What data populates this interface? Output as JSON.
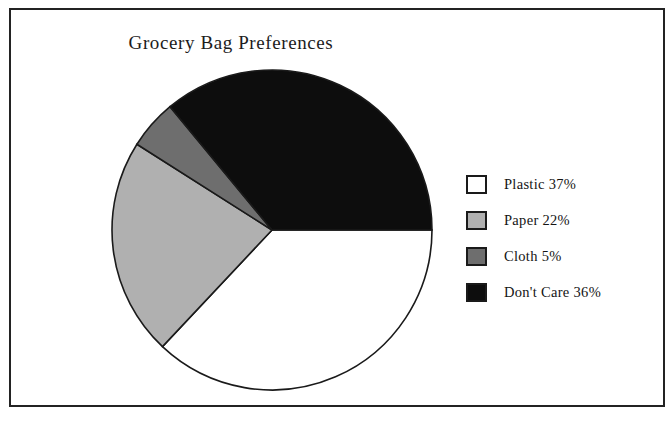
{
  "chart_data": {
    "type": "pie",
    "title": "Grocery Bag Preferences",
    "categories": [
      "Plastic",
      "Paper",
      "Cloth",
      "Don't Care"
    ],
    "values": [
      37,
      22,
      5,
      36
    ],
    "value_unit": "%",
    "labels": [
      "Plastic 37%",
      "Paper 22%",
      "Cloth 5%",
      "Don't Care 36%"
    ],
    "colors": [
      "#ffffff",
      "#b0b0b0",
      "#6e6e6e",
      "#0d0d0d"
    ],
    "slice_border_color": "#1a1a1a",
    "start_angle_deg": 0,
    "direction": "clockwise",
    "legend_position": "right",
    "grid": false,
    "xlabel": "",
    "ylabel": ""
  },
  "legend": {
    "items": [
      {
        "label": "Plastic 37%",
        "color": "#ffffff",
        "name": "plastic"
      },
      {
        "label": "Paper 22%",
        "color": "#b0b0b0",
        "name": "paper"
      },
      {
        "label": "Cloth 5%",
        "color": "#6e6e6e",
        "name": "cloth"
      },
      {
        "label": "Don't Care 36%",
        "color": "#0d0d0d",
        "name": "dont-care"
      }
    ]
  },
  "frame": {
    "border_color": "#232323",
    "background": "#ffffff"
  }
}
